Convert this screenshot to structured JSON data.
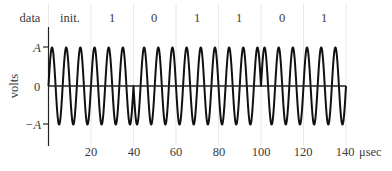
{
  "chart_data": {
    "type": "line",
    "title": "",
    "xlabel": "μsec",
    "ylabel": "volts",
    "xlim": [
      0,
      140
    ],
    "xticks": [
      20,
      40,
      60,
      80,
      100,
      120,
      140
    ],
    "xtick_labels": [
      "20",
      "40",
      "60",
      "80",
      "100",
      "120",
      "140"
    ],
    "yticks": [
      "A",
      "0",
      "−A"
    ],
    "ylim_labels": {
      "top": "A",
      "zero": "0",
      "bottom": "−A"
    },
    "grid": "faint vertical lines at bit boundaries",
    "carrier": {
      "amplitude": "A",
      "period_us": 6.6667,
      "cycles_per_bit": 3,
      "bit_duration_us": 20,
      "phase_reversals_at_us": [
        40,
        100
      ]
    },
    "data_row": {
      "label": "data",
      "segments": [
        {
          "label": "init.",
          "start": 0,
          "end": 20
        },
        {
          "label": "1",
          "start": 20,
          "end": 40
        },
        {
          "label": "0",
          "start": 40,
          "end": 60
        },
        {
          "label": "1",
          "start": 60,
          "end": 80
        },
        {
          "label": "1",
          "start": 80,
          "end": 100
        },
        {
          "label": "0",
          "start": 100,
          "end": 120
        },
        {
          "label": "1",
          "start": 120,
          "end": 140
        }
      ]
    }
  },
  "labels": {
    "data": "data",
    "volts": "volts",
    "unit": "μsec",
    "A": "A",
    "zero": "0",
    "minusA": "−A",
    "seg0": "init.",
    "seg1": "1",
    "seg2": "0",
    "seg3": "1",
    "seg4": "1",
    "seg5": "0",
    "seg6": "1",
    "x20": "20",
    "x40": "40",
    "x60": "60",
    "x80": "80",
    "x100": "100",
    "x120": "120",
    "x140": "140"
  },
  "colors": {
    "wave": "#111111",
    "axis": "#222222",
    "grid": "#e6e6e6",
    "text": "#3a3a3a"
  }
}
